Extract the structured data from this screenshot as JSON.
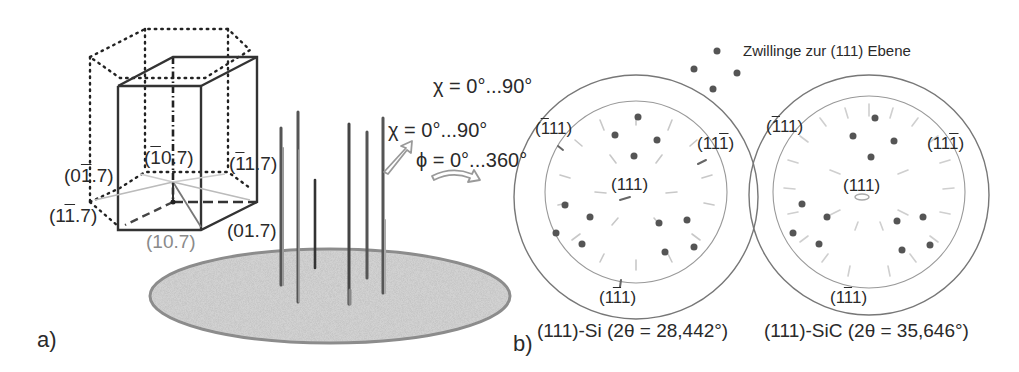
{
  "panel_a": {
    "label": "a)",
    "crystal_labels": {
      "top_center": {
        "pre": "(",
        "bar": "1",
        "post": "0.7)"
      },
      "top_right": {
        "pre": "(",
        "bar": "1",
        "post": "1.7)"
      },
      "left_upper": {
        "pre": "(0",
        "bar": "1",
        "post": ".7)"
      },
      "left_lower": {
        "pre": "(1",
        "bar": "1",
        "post": ".7)"
      },
      "bottom_center": "(10.7)",
      "bottom_right": "(01.7)"
    },
    "chi_label": "χ = 0°...90°",
    "phi_label": "ϕ = 0°...360°"
  },
  "panel_b": {
    "label": "b)",
    "chi_label": "χ = 0°...90°",
    "legend": {
      "text": "Zwillinge zur (111) Ebene",
      "icon": "dot-icon"
    },
    "pole_figures": [
      {
        "caption": "(111)-Si (2θ = 28,442°)",
        "center": "(111)",
        "poles": {
          "upper_left": {
            "pre": "(",
            "bar": "1",
            "post": "11)"
          },
          "upper_right": {
            "pre": "(11",
            "bar": "1",
            "post": ")"
          },
          "bottom": {
            "pre": "(1",
            "bar": "1",
            "post": "1)"
          }
        }
      },
      {
        "caption": "(111)-SiC (2θ = 35,646°)",
        "center": "(111)",
        "poles": {
          "upper_left": {
            "pre": "(",
            "bar": "1",
            "post": "11)"
          },
          "upper_right": {
            "pre": "(11",
            "bar": "1",
            "post": ")"
          },
          "bottom": {
            "pre": "(1",
            "bar": "1",
            "post": "1)"
          }
        }
      }
    ]
  },
  "colors": {
    "line_dark": "#333333",
    "line_gray": "#999999",
    "substrate_fill": "#cfcfcf",
    "substrate_edge": "#8c8c8c",
    "dot": "#555555"
  }
}
